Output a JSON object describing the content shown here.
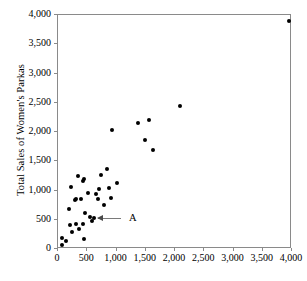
{
  "chart_data": {
    "type": "scatter",
    "title": "",
    "xlabel": "",
    "ylabel": "Total Sales of Women's Parkas",
    "xlim": [
      0,
      4000
    ],
    "ylim": [
      0,
      4000
    ],
    "grid": false,
    "legend": null,
    "xticks": [
      "0",
      "500",
      "1,000",
      "1,500",
      "2,000",
      "2,500",
      "3,000",
      "3,500",
      "4,000"
    ],
    "xtick_values": [
      0,
      500,
      1000,
      1500,
      2000,
      2500,
      3000,
      3500,
      4000
    ],
    "yticks": [
      "0",
      "500",
      "1,000",
      "1,500",
      "2,000",
      "2,500",
      "3,000",
      "3,500",
      "4,000"
    ],
    "ytick_values": [
      0,
      500,
      1000,
      1500,
      2000,
      2500,
      3000,
      3500,
      4000
    ],
    "points": [
      [
        60,
        180
      ],
      [
        60,
        60
      ],
      [
        130,
        130
      ],
      [
        190,
        680
      ],
      [
        200,
        410
      ],
      [
        230,
        1060
      ],
      [
        240,
        290
      ],
      [
        290,
        840
      ],
      [
        300,
        860
      ],
      [
        310,
        420
      ],
      [
        350,
        1250
      ],
      [
        360,
        350
      ],
      [
        400,
        850
      ],
      [
        420,
        1160
      ],
      [
        430,
        420
      ],
      [
        440,
        170
      ],
      [
        450,
        1190
      ],
      [
        470,
        620
      ],
      [
        510,
        950
      ],
      [
        540,
        540
      ],
      [
        580,
        480
      ],
      [
        620,
        530
      ],
      [
        650,
        940
      ],
      [
        680,
        850
      ],
      [
        700,
        1030
      ],
      [
        740,
        1270
      ],
      [
        790,
        760
      ],
      [
        830,
        1360
      ],
      [
        870,
        1040
      ],
      [
        910,
        880
      ],
      [
        930,
        2030
      ],
      [
        1010,
        1130
      ],
      [
        1370,
        2150
      ],
      [
        1490,
        1860
      ],
      [
        1560,
        2210
      ],
      [
        1630,
        1700
      ],
      [
        2080,
        2450
      ],
      [
        3950,
        3900
      ]
    ],
    "annotations": [
      {
        "label": "A",
        "point": [
          620,
          530
        ],
        "label_x": 1180,
        "label_y": 530
      }
    ]
  }
}
